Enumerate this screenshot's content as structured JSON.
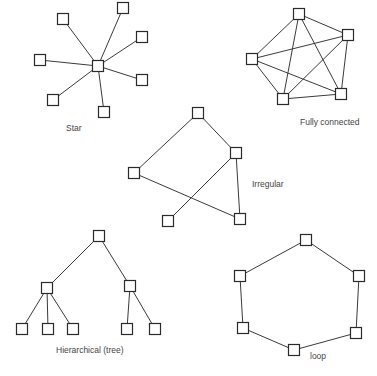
{
  "diagrams": {
    "star": {
      "label": "Star",
      "label_pos": [
        66,
        124
      ],
      "nodes": [
        [
          98,
          66
        ],
        [
          63,
          19
        ],
        [
          123,
          8
        ],
        [
          142,
          37
        ],
        [
          40,
          60
        ],
        [
          142,
          80
        ],
        [
          53,
          100
        ],
        [
          104,
          112
        ]
      ],
      "edges": [
        [
          0,
          1
        ],
        [
          0,
          2
        ],
        [
          0,
          3
        ],
        [
          0,
          4
        ],
        [
          0,
          5
        ],
        [
          0,
          6
        ],
        [
          0,
          7
        ]
      ]
    },
    "fully_connected": {
      "label": "Fully connected",
      "label_pos": [
        300,
        118
      ],
      "nodes": [
        [
          299,
          14
        ],
        [
          348,
          35
        ],
        [
          252,
          59
        ],
        [
          283,
          99
        ],
        [
          341,
          94
        ]
      ],
      "edges": [
        [
          0,
          1
        ],
        [
          0,
          2
        ],
        [
          0,
          3
        ],
        [
          0,
          4
        ],
        [
          1,
          2
        ],
        [
          1,
          3
        ],
        [
          1,
          4
        ],
        [
          2,
          3
        ],
        [
          2,
          4
        ],
        [
          3,
          4
        ]
      ]
    },
    "irregular": {
      "label": "Irregular",
      "label_pos": [
        252,
        180
      ],
      "nodes": [
        [
          198,
          113
        ],
        [
          236,
          153
        ],
        [
          134,
          173
        ],
        [
          168,
          221
        ],
        [
          240,
          219
        ]
      ],
      "edges": [
        [
          0,
          1
        ],
        [
          0,
          2
        ],
        [
          1,
          3
        ],
        [
          1,
          4
        ],
        [
          2,
          4
        ]
      ]
    },
    "hierarchical": {
      "label": "Hierarchical (tree)",
      "label_pos": [
        56,
        346
      ],
      "nodes": [
        [
          99,
          236
        ],
        [
          47,
          288
        ],
        [
          130,
          286
        ],
        [
          22,
          329
        ],
        [
          48,
          329
        ],
        [
          73,
          329
        ],
        [
          127,
          329
        ],
        [
          155,
          329
        ]
      ],
      "edges": [
        [
          0,
          1
        ],
        [
          0,
          2
        ],
        [
          1,
          3
        ],
        [
          1,
          4
        ],
        [
          1,
          5
        ],
        [
          2,
          6
        ],
        [
          2,
          7
        ]
      ]
    },
    "loop": {
      "label": "loop",
      "label_pos": [
        310,
        352
      ],
      "nodes": [
        [
          306,
          240
        ],
        [
          359,
          276
        ],
        [
          356,
          333
        ],
        [
          294,
          350
        ],
        [
          243,
          328
        ],
        [
          240,
          276
        ]
      ],
      "edges": [
        [
          0,
          1
        ],
        [
          1,
          2
        ],
        [
          2,
          3
        ],
        [
          3,
          4
        ],
        [
          4,
          5
        ],
        [
          5,
          0
        ]
      ]
    }
  },
  "style": {
    "node_size": 11,
    "edge_color": "#3a3a3a",
    "node_stroke": "#2a2a2a",
    "label_color": "#444444"
  }
}
